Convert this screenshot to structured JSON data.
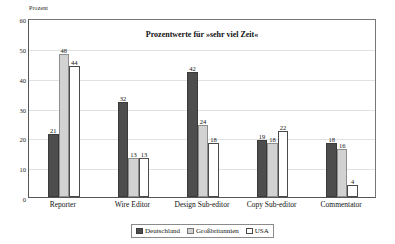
{
  "chart_data": {
    "type": "bar",
    "title": "Prozentwerte für »sehr viel Zeit«",
    "xlabel": "",
    "ylabel": "Prozent",
    "ylim": [
      0,
      60
    ],
    "yticks": [
      0,
      10,
      20,
      30,
      40,
      50,
      60
    ],
    "grid": true,
    "legend_position": "bottom",
    "categories": [
      "Reporter",
      "Wire Editor",
      "Design Sub-editor",
      "Copy Sub-editor",
      "Commentator"
    ],
    "series": [
      {
        "name": "Deutschland",
        "color": "#4d4d4d",
        "values": [
          21,
          32,
          42,
          19,
          18
        ]
      },
      {
        "name": "Großbritannien",
        "color": "#d2d2d2",
        "values": [
          48,
          13,
          24,
          18,
          16
        ]
      },
      {
        "name": "USA",
        "color": "#ffffff",
        "values": [
          44,
          13,
          18,
          22,
          4
        ]
      }
    ]
  },
  "axis": {
    "unit_label": "Prozent"
  }
}
